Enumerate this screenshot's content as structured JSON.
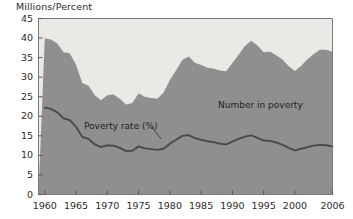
{
  "chart_data": {
    "type": "area",
    "title": "",
    "ylabel": "Millions/Percent",
    "xlabel": "",
    "ylim": [
      0,
      45
    ],
    "xlim": [
      1959,
      2006
    ],
    "yticks": [
      0,
      5,
      10,
      15,
      20,
      25,
      30,
      35,
      40,
      45
    ],
    "xticks": [
      1960,
      1965,
      1970,
      1975,
      1980,
      1985,
      1990,
      1995,
      2000,
      2006
    ],
    "grid": false,
    "legend_position": "inline-annotations",
    "annotations": [
      {
        "text": "Number in poverty",
        "x": 1990,
        "y": 28
      },
      {
        "text": "Poverty rate (%)",
        "x": 1971,
        "y": 17
      }
    ],
    "x": [
      1960,
      1961,
      1962,
      1963,
      1964,
      1965,
      1966,
      1967,
      1968,
      1969,
      1970,
      1971,
      1972,
      1973,
      1974,
      1975,
      1976,
      1977,
      1978,
      1979,
      1980,
      1981,
      1982,
      1983,
      1984,
      1985,
      1986,
      1987,
      1988,
      1989,
      1990,
      1991,
      1992,
      1993,
      1994,
      1995,
      1996,
      1997,
      1998,
      1999,
      2000,
      2001,
      2002,
      2003,
      2004,
      2005,
      2006
    ],
    "series": [
      {
        "name": "Number in poverty",
        "units": "millions",
        "render": "area",
        "color": "#8f8f8f",
        "values": [
          39.9,
          39.6,
          38.6,
          36.4,
          36.1,
          33.2,
          28.5,
          27.8,
          25.4,
          24.1,
          25.4,
          25.6,
          24.5,
          23.0,
          23.4,
          25.9,
          25.0,
          24.7,
          24.5,
          26.1,
          29.3,
          31.8,
          34.4,
          35.3,
          33.7,
          33.1,
          32.4,
          32.2,
          31.7,
          31.5,
          33.6,
          35.7,
          38.0,
          39.3,
          38.1,
          36.4,
          36.5,
          35.6,
          34.5,
          32.8,
          31.6,
          32.9,
          34.6,
          35.9,
          37.0,
          37.0,
          36.5
        ]
      },
      {
        "name": "Poverty rate (%)",
        "units": "percent",
        "render": "line",
        "color": "#4a4a4a",
        "values": [
          22.2,
          21.9,
          21.0,
          19.5,
          19.0,
          17.3,
          14.7,
          14.2,
          12.8,
          12.1,
          12.6,
          12.5,
          11.9,
          11.1,
          11.2,
          12.3,
          11.8,
          11.6,
          11.4,
          11.7,
          13.0,
          14.0,
          15.0,
          15.2,
          14.4,
          14.0,
          13.6,
          13.4,
          13.0,
          12.8,
          13.5,
          14.2,
          14.8,
          15.1,
          14.5,
          13.8,
          13.7,
          13.3,
          12.7,
          11.9,
          11.3,
          11.7,
          12.1,
          12.5,
          12.7,
          12.6,
          12.3
        ]
      }
    ]
  },
  "style": {
    "area_fill": "#8f8f8f",
    "plot_background": "#e9e9e5",
    "line_color": "#4a4a4a",
    "axis_color": "#7a7a7a",
    "text_color": "#2b2b2b"
  }
}
